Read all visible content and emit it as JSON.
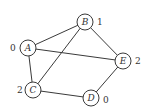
{
  "graph": {
    "nodes": [
      {
        "id": "A",
        "label": "A",
        "value": "0",
        "cx": 28,
        "cy": 48,
        "vx": 10,
        "vy": 51
      },
      {
        "id": "B",
        "label": "B",
        "value": "1",
        "cx": 85,
        "cy": 22,
        "vx": 97,
        "vy": 25
      },
      {
        "id": "E",
        "label": "E",
        "value": "2",
        "cx": 123,
        "cy": 61,
        "vx": 135,
        "vy": 64
      },
      {
        "id": "C",
        "label": "C",
        "value": "2",
        "cx": 33,
        "cy": 90,
        "vx": 17,
        "vy": 93
      },
      {
        "id": "D",
        "label": "D",
        "value": "0",
        "cx": 91,
        "cy": 98,
        "vx": 103,
        "vy": 103
      }
    ],
    "edges": [
      {
        "from": "A",
        "to": "B"
      },
      {
        "from": "A",
        "to": "E"
      },
      {
        "from": "A",
        "to": "C"
      },
      {
        "from": "B",
        "to": "C"
      },
      {
        "from": "B",
        "to": "E"
      },
      {
        "from": "C",
        "to": "D"
      },
      {
        "from": "D",
        "to": "E"
      }
    ],
    "node_radius": 8
  }
}
